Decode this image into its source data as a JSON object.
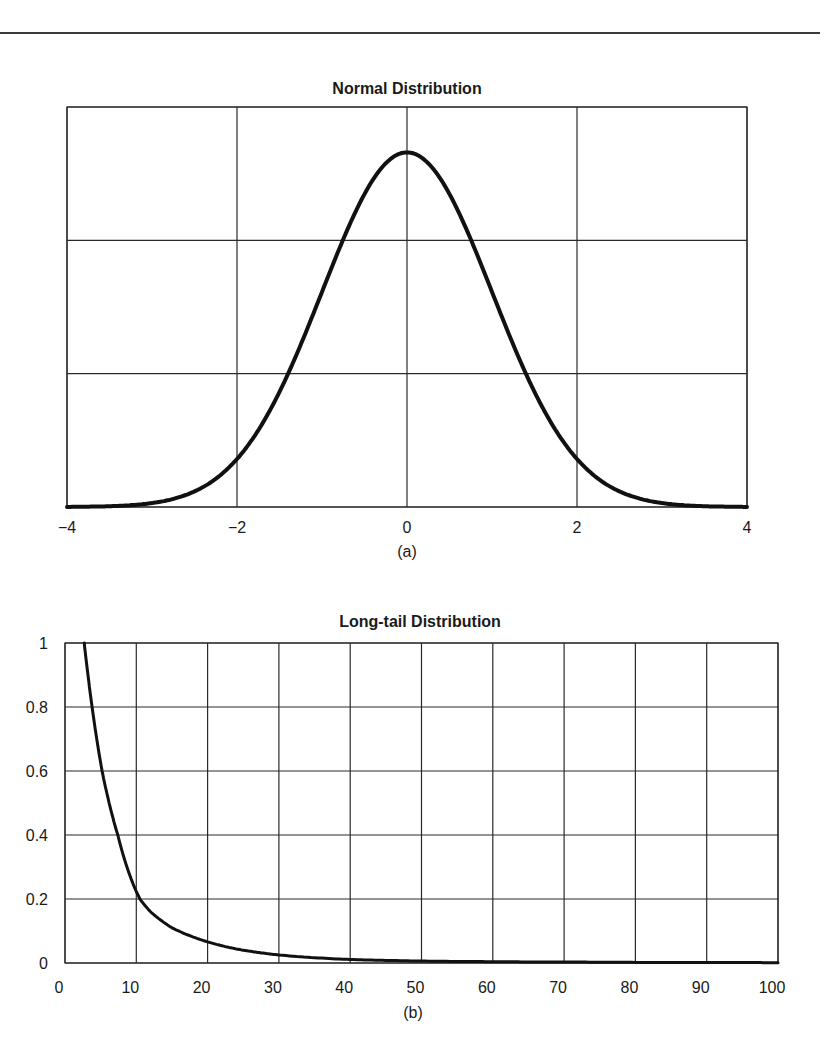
{
  "chart_data": [
    {
      "type": "line",
      "title": "Normal Distribution",
      "caption": "(a)",
      "xlabel": "",
      "ylabel": "",
      "xlim": [
        -4,
        4
      ],
      "ylim": [
        0,
        0.45
      ],
      "x_ticks": [
        -4,
        -2,
        0,
        2,
        4
      ],
      "x_tick_labels": [
        "−4",
        "−2",
        "0",
        "2",
        "4"
      ],
      "y_ticks": [
        0,
        0.15,
        0.3,
        0.45
      ],
      "y_tick_labels": [],
      "grid": true,
      "series": [
        {
          "name": "Normal pdf (mean 0, sd 1)",
          "x": [
            -4,
            -3.5,
            -3,
            -2.5,
            -2,
            -1.5,
            -1,
            -0.5,
            0,
            0.5,
            1,
            1.5,
            2,
            2.5,
            3,
            3.5,
            4
          ],
          "values": [
            0.0001,
            0.0009,
            0.0044,
            0.0175,
            0.054,
            0.1295,
            0.242,
            0.3521,
            0.3989,
            0.3521,
            0.242,
            0.1295,
            0.054,
            0.0175,
            0.0044,
            0.0009,
            0.0001
          ]
        }
      ]
    },
    {
      "type": "line",
      "title": "Long-tail Distribution",
      "caption": "(b)",
      "xlabel": "",
      "ylabel": "",
      "xlim": [
        0,
        100
      ],
      "ylim": [
        0,
        1
      ],
      "x_ticks": [
        0,
        10,
        20,
        30,
        40,
        50,
        60,
        70,
        80,
        90,
        100
      ],
      "x_tick_labels": [
        "0",
        "10",
        "20",
        "30",
        "40",
        "50",
        "60",
        "70",
        "80",
        "90",
        "100"
      ],
      "y_ticks": [
        0,
        0.2,
        0.4,
        0.6,
        0.8,
        1
      ],
      "y_tick_labels": [
        "0",
        "0.2",
        "0.4",
        "0.6",
        "0.8",
        "1"
      ],
      "grid": true,
      "series": [
        {
          "name": "Long-tail",
          "x": [
            2.7,
            3.8,
            5.2,
            7.4,
            10.5,
            12,
            15,
            20,
            25,
            30,
            40,
            50,
            60,
            70,
            80,
            90,
            100
          ],
          "values": [
            1.0,
            0.8,
            0.6,
            0.4,
            0.2,
            0.16,
            0.11,
            0.066,
            0.04,
            0.025,
            0.011,
            0.006,
            0.004,
            0.003,
            0.002,
            0.0015,
            0.001
          ]
        }
      ]
    }
  ]
}
